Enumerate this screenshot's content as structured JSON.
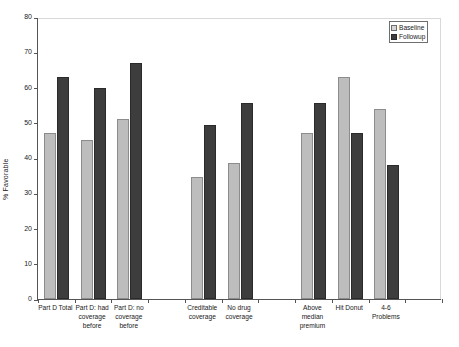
{
  "chart_data": {
    "type": "bar",
    "title": "",
    "xlabel": "",
    "ylabel": "% Favorable",
    "ylim": [
      0,
      80
    ],
    "yticks": [
      0,
      10,
      20,
      30,
      40,
      50,
      60,
      70,
      80
    ],
    "grid": false,
    "legend_position": "top-right",
    "categories": [
      "Part D Total",
      "Part D: had coverage before",
      "Part D: no coverage before",
      "Creditable coverage",
      "No drug coverage",
      "Above median premium",
      "Hit Donut",
      "4-6 Problems"
    ],
    "series": [
      {
        "name": "Baseline",
        "color": "#bdbdbd",
        "values": [
          47,
          45,
          51,
          34.5,
          38.5,
          47,
          63,
          54
        ]
      },
      {
        "name": "Followup",
        "color": "#3d3d3d",
        "values": [
          63,
          60,
          67,
          49.5,
          55.5,
          55.5,
          47,
          38
        ]
      }
    ]
  },
  "axis": {
    "y_title": "% Favorable",
    "y_tick_labels": [
      "0",
      "10",
      "20",
      "30",
      "40",
      "50",
      "60",
      "70",
      "80"
    ],
    "x_tick_labels": [
      [
        "Part D Total"
      ],
      [
        "Part D: had",
        "coverage",
        "before"
      ],
      [
        "Part D: no",
        "coverage",
        "before"
      ],
      [
        "Creditable",
        "coverage"
      ],
      [
        "No drug",
        "coverage"
      ],
      [
        "Above",
        "median",
        "premium"
      ],
      [
        "Hit Donut"
      ],
      [
        "4-6",
        "Problems"
      ]
    ]
  },
  "legend": {
    "items": [
      {
        "label": "Baseline",
        "swatch": "baseline-swatch"
      },
      {
        "label": "Followup",
        "swatch": "followup-swatch"
      }
    ]
  }
}
